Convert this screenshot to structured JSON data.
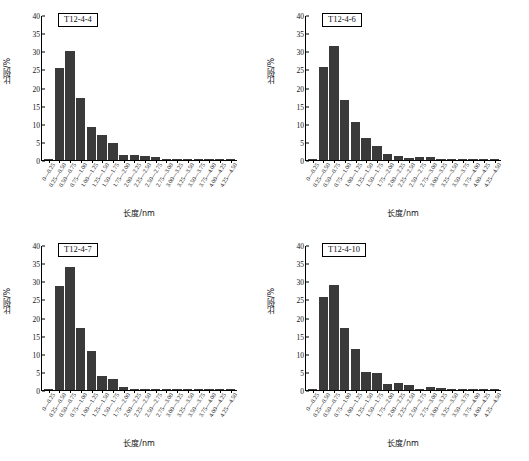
{
  "figure": {
    "axis": {
      "ylabel": "比例/%",
      "xlabel": "长度/nm",
      "yticks": [
        "0",
        "5",
        "10",
        "15",
        "20",
        "25",
        "30",
        "35",
        "40"
      ],
      "ylim": [
        0,
        40
      ],
      "xticklabels": [
        "0—0.25",
        "0.25—0.50",
        "0.50—0.75",
        "0.75—1.00",
        "1.00—1.25",
        "1.25—1.50",
        "1.50—1.75",
        "1.75—2.00",
        "2.00—2.25",
        "2.25—2.50",
        "2.50—2.75",
        "2.75—3.00",
        "3.00—3.25",
        "3.25—3.50",
        "3.50—3.75",
        "3.75—4.00",
        "4.00—4.25",
        "4.25—4.50"
      ]
    },
    "bar_color": "#3a3a3a"
  },
  "chart_data": [
    {
      "type": "bar",
      "title": "T12-4-4",
      "xlabel": "长度/nm",
      "ylabel": "比例/%",
      "ylim": [
        0,
        40
      ],
      "grid": false,
      "legend": "none",
      "categories": [
        "0—0.25",
        "0.25—0.50",
        "0.50—0.75",
        "0.75—1.00",
        "1.00—1.25",
        "1.25—1.50",
        "1.50—1.75",
        "1.75—2.00",
        "2.00—2.25",
        "2.25—2.50",
        "2.50—2.75",
        "2.75—3.00",
        "3.00—3.25",
        "3.25—3.50",
        "3.50—3.75",
        "3.75—4.00",
        "4.00—4.25",
        "4.25—4.50"
      ],
      "values": [
        0.4,
        25.4,
        30.1,
        17.2,
        9.1,
        6.8,
        4.6,
        1.5,
        1.3,
        1.2,
        0.7,
        0.4,
        0.1,
        0.1,
        0.1,
        0.1,
        0.0,
        0.0
      ]
    },
    {
      "type": "bar",
      "title": "T12-4-6",
      "xlabel": "长度/nm",
      "ylabel": "比例/%",
      "ylim": [
        0,
        40
      ],
      "grid": false,
      "legend": "none",
      "categories": [
        "0—0.25",
        "0.25—0.50",
        "0.50—0.75",
        "0.75—1.00",
        "1.00—1.25",
        "1.25—1.50",
        "1.50—1.75",
        "1.75—2.00",
        "2.00—2.25",
        "2.25—2.50",
        "2.50—2.75",
        "2.75—3.00",
        "3.00—3.25",
        "3.25—3.50",
        "3.50—3.75",
        "3.75—4.00",
        "4.00—4.25",
        "4.25—4.50"
      ],
      "values": [
        0.3,
        25.6,
        31.4,
        16.5,
        10.4,
        6.0,
        3.8,
        1.6,
        1.2,
        0.5,
        0.9,
        0.8,
        0.2,
        0.2,
        0.1,
        0.1,
        0.1,
        0.1
      ]
    },
    {
      "type": "bar",
      "title": "T12-4-7",
      "xlabel": "长度/nm",
      "ylabel": "比例/%",
      "ylim": [
        0,
        40
      ],
      "grid": false,
      "legend": "none",
      "categories": [
        "0—0.25",
        "0.25—0.50",
        "0.50—0.75",
        "0.75—1.00",
        "1.00—1.25",
        "1.25—1.50",
        "1.50—1.75",
        "1.75—2.00",
        "2.00—2.25",
        "2.25—2.50",
        "2.50—2.75",
        "2.75—3.00",
        "3.00—3.25",
        "3.25—3.50",
        "3.50—3.75",
        "3.75—4.00",
        "4.00—4.25",
        "4.25—4.50"
      ],
      "values": [
        0.3,
        28.8,
        33.8,
        17.0,
        10.7,
        3.9,
        3.1,
        0.9,
        0.2,
        0.2,
        0.4,
        0.1,
        0.1,
        0.1,
        0.1,
        0.1,
        0.0,
        0.0
      ]
    },
    {
      "type": "bar",
      "title": "T12-4-10",
      "xlabel": "长度/nm",
      "ylabel": "比例/%",
      "ylim": [
        0,
        40
      ],
      "grid": false,
      "legend": "none",
      "categories": [
        "0—0.25",
        "0.25—0.50",
        "0.50—0.75",
        "0.75—1.00",
        "1.00—1.25",
        "1.25—1.50",
        "1.50—1.75",
        "1.75—2.00",
        "2.00—2.25",
        "2.25—2.50",
        "2.50—2.75",
        "2.75—3.00",
        "3.00—3.25",
        "3.25—3.50",
        "3.50—3.75",
        "3.75—4.00",
        "4.00—4.25",
        "4.25—4.50"
      ],
      "values": [
        0.4,
        25.6,
        28.9,
        17.0,
        11.3,
        5.0,
        4.8,
        1.6,
        1.8,
        1.3,
        0.4,
        0.7,
        0.6,
        0.2,
        0.1,
        0.2,
        0.1,
        0.1
      ]
    }
  ]
}
